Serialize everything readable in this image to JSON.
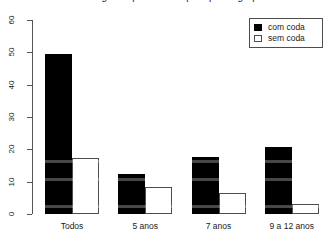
{
  "chart_data": {
    "type": "bar",
    "title": "As categorias por idade e por tipo de grupo",
    "xlabel": "",
    "ylabel": "",
    "categories": [
      "Todos",
      "5 anos",
      "7 anos",
      "9 a 12 anos"
    ],
    "series": [
      {
        "name": "com coda",
        "values": [
          49.5,
          12.5,
          17.5,
          20.8
        ],
        "color": "#000000",
        "style": "filled"
      },
      {
        "name": "sem coda",
        "values": [
          17.3,
          8.4,
          6.5,
          3.2
        ],
        "color": "#ffffff",
        "style": "open"
      }
    ],
    "ylim": [
      0,
      60
    ],
    "yticks": [
      0,
      10,
      20,
      30,
      40,
      50,
      60
    ],
    "ytick_labels": [
      "0",
      "10",
      "20",
      "30",
      "40",
      "50",
      "60"
    ],
    "grid": false,
    "legend_position": "top-right",
    "legend_entries": [
      "com coda",
      "sem coda"
    ]
  },
  "legend": {
    "entries": [
      {
        "label": "com coda",
        "key": "filled-square-icon"
      },
      {
        "label": "sem coda",
        "key": "open-square-icon"
      }
    ]
  }
}
